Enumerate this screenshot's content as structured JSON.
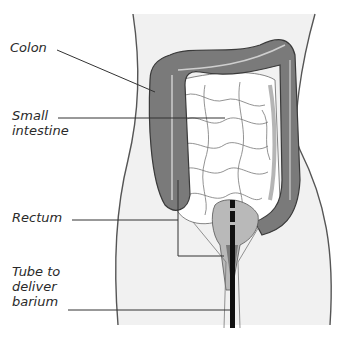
{
  "diagram": {
    "colors": {
      "colon": "#7a7a7a",
      "colon_outline": "#3a3a3a",
      "small_intestine": "#ffffff",
      "rectum": "#b9b9b9",
      "body_fill": "#f1f1f1",
      "tube": "#111111",
      "leader_line": "#333333"
    },
    "labels": [
      {
        "id": "colon",
        "text": "Colon"
      },
      {
        "id": "small-intestine",
        "text": "Small\nintestine"
      },
      {
        "id": "rectum",
        "text": "Rectum"
      },
      {
        "id": "tube",
        "text": "Tube to\ndeliver\nbarium"
      }
    ]
  }
}
